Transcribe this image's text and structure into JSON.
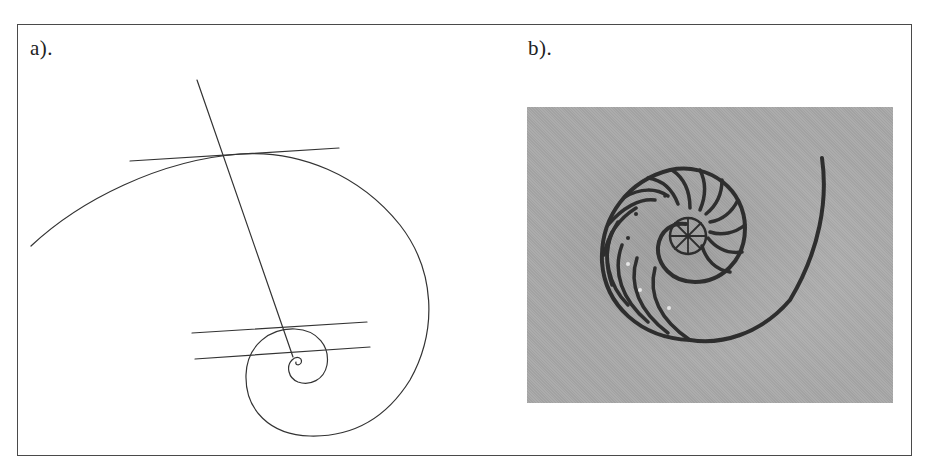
{
  "figure": {
    "panel_a": {
      "label": "a).",
      "content": "logarithmic spiral with radial line and three tangent lines",
      "stroke_color": "#333333"
    },
    "panel_b": {
      "label": "b).",
      "content": "photograph of a cross-sectioned nautilus shell",
      "background_color": "#a9a9a9",
      "shell_color": "#2e2e2e"
    },
    "frame_color": "#4a4a4a"
  }
}
